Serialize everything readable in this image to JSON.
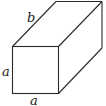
{
  "diagram": {
    "type": "cuboid",
    "colors": {
      "stroke": "#2a2a2a",
      "label": "#222222",
      "background": "#ffffff"
    },
    "labels": {
      "depth": "b",
      "height": "a",
      "width": "a"
    }
  }
}
